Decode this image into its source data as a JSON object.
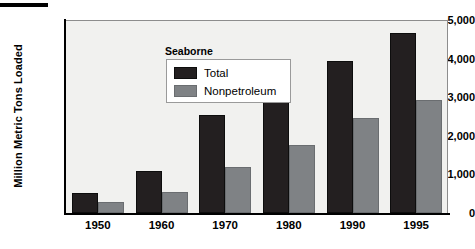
{
  "chart_data": {
    "type": "bar",
    "title": "",
    "subtitle": "",
    "xlabel": "",
    "ylabel": "Million Metric Tons Loaded",
    "categories": [
      "1950",
      "1960",
      "1970",
      "1980",
      "1990",
      "1995"
    ],
    "series": [
      {
        "name": "Total",
        "color": "#231f20",
        "values": [
          520,
          1080,
          2550,
          3650,
          3950,
          4670
        ]
      },
      {
        "name": "Nonpetroleum",
        "color": "#7f8285",
        "values": [
          290,
          550,
          1180,
          1770,
          2460,
          2920
        ]
      }
    ],
    "ylim": [
      0,
      5000
    ],
    "ytick_values": [
      0,
      1000,
      2000,
      3000,
      4000,
      5000
    ],
    "ytick_labels": [
      "0",
      "1,000",
      "2,000",
      "3,000",
      "4,000",
      "5,000"
    ],
    "grid": false,
    "legend": {
      "position": "inside-top-left",
      "title": "Seaborne",
      "entries": [
        "Total",
        "Nonpetroleum"
      ]
    },
    "plot_background": "#f1f1ef"
  }
}
